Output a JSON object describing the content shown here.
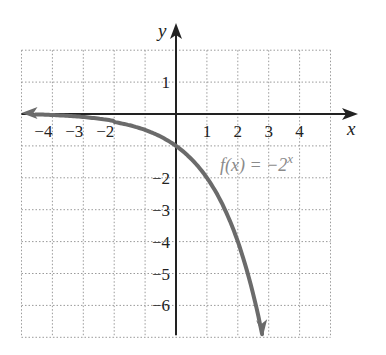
{
  "chart_data": {
    "type": "line",
    "title": "",
    "xlabel": "x",
    "ylabel": "y",
    "xlim": [
      -5,
      5
    ],
    "ylim": [
      -7,
      2
    ],
    "grid": true,
    "grid_style": "dotted",
    "x_ticks": [
      -4,
      -3,
      -2,
      1,
      2,
      3,
      4
    ],
    "x_tick_labels": [
      "−4",
      "−3",
      "−2",
      "1",
      "2",
      "3",
      "4"
    ],
    "y_ticks": [
      1,
      -2,
      -3,
      -4,
      -5,
      -6
    ],
    "y_tick_labels": [
      "1",
      "−2",
      "−3",
      "−4",
      "−5",
      "−6"
    ],
    "series": [
      {
        "name": "f(x) = −2^x",
        "function": "-2^x",
        "x": [
          -5,
          -4,
          -3,
          -2,
          -1,
          0,
          1,
          2,
          2.5,
          2.81
        ],
        "y": [
          -0.03125,
          -0.0625,
          -0.125,
          -0.25,
          -0.5,
          -1,
          -2,
          -4,
          -5.66,
          -7
        ],
        "color": "#6b6b6b",
        "arrows": "both"
      }
    ],
    "annotations": [
      {
        "text": "f(x) = −2",
        "superscript": "x",
        "x": 1.4,
        "y": -1.6
      }
    ]
  },
  "labels": {
    "x_axis": "x",
    "y_axis": "y",
    "function_main": "f(x) = −2",
    "function_sup": "x"
  },
  "colors": {
    "axis": "#222222",
    "grid": "#9a9a9a",
    "curve": "#6b6b6b",
    "label": "#8a8a8a"
  }
}
